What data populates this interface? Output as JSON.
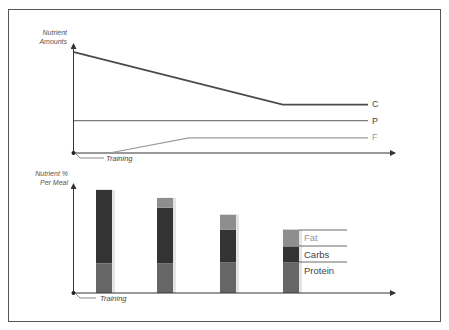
{
  "chart_data": [
    {
      "type": "line",
      "title": "",
      "ylabel": "Nutrient Amounts",
      "xlabel": "",
      "annotations": [
        {
          "text": "Training",
          "at": "origin"
        }
      ],
      "x": [
        0,
        0.12,
        0.39,
        0.71,
        1.0
      ],
      "series": [
        {
          "name": "C",
          "label": "C",
          "color": "#4a4a4a",
          "points": [
            [
              0,
              100
            ],
            [
              0.71,
              48
            ],
            [
              1.0,
              48
            ]
          ]
        },
        {
          "name": "P",
          "label": "P",
          "color": "#7a7a7a",
          "points": [
            [
              0,
              32
            ],
            [
              1.0,
              32
            ]
          ]
        },
        {
          "name": "F",
          "label": "F",
          "color": "#9a9a9a",
          "points": [
            [
              0.12,
              0
            ],
            [
              0.39,
              15
            ],
            [
              1.0,
              15
            ]
          ]
        }
      ],
      "ylim": [
        0,
        110
      ],
      "grid": false,
      "legend": "inline-right"
    },
    {
      "type": "bar",
      "stacked": true,
      "title": "",
      "ylabel": "Nutrient % Per Meal",
      "xlabel": "",
      "annotations": [
        {
          "text": "Training",
          "at": "origin"
        }
      ],
      "categories": [
        "Meal 1",
        "Meal 2",
        "Meal 3",
        "Meal 4"
      ],
      "series": [
        {
          "name": "Protein",
          "color": "#666666",
          "values": [
            30,
            30,
            31,
            31
          ]
        },
        {
          "name": "Carbs",
          "color": "#333333",
          "values": [
            74,
            56,
            33,
            16
          ]
        },
        {
          "name": "Fat",
          "color": "#8e8e8e",
          "values": [
            0,
            10,
            15,
            17
          ]
        }
      ],
      "ylim": [
        0,
        110
      ],
      "grid": false,
      "legend": "inline-right-of-last-bar"
    }
  ],
  "top_chart": {
    "ylabel_line1": "Nutrient",
    "ylabel_line2": "Amounts",
    "callout": "Training",
    "labels": {
      "c": "C",
      "p": "P",
      "f": "F"
    }
  },
  "bottom_chart": {
    "ylabel_line1": "Nutrient %",
    "ylabel_line2": "Per Meal",
    "callout": "Training",
    "legend": {
      "fat": "Fat",
      "carbs": "Carbs",
      "protein": "Protein"
    }
  }
}
